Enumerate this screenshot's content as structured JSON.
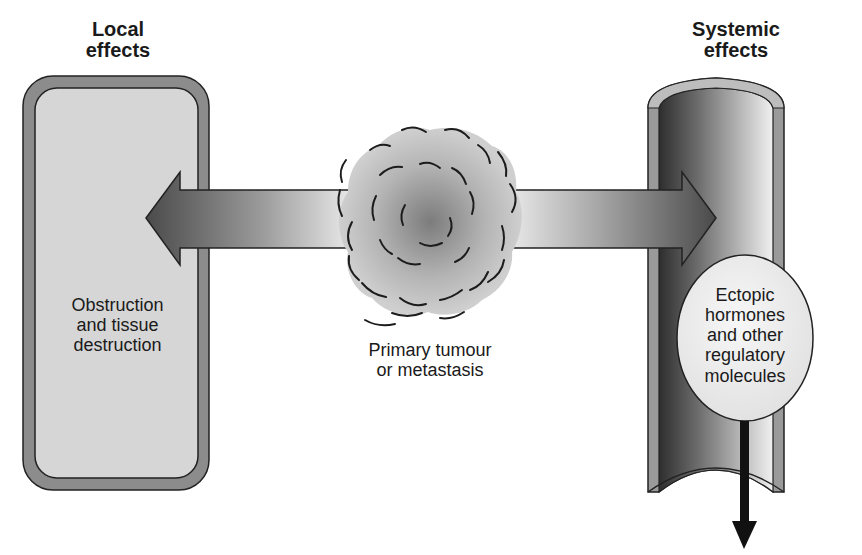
{
  "diagram": {
    "left": {
      "heading_line1": "Local",
      "heading_line2": "effects",
      "box_label_line1": "Obstruction",
      "box_label_line2": "and tissue",
      "box_label_line3": "destruction"
    },
    "center": {
      "label_line1": "Primary tumour",
      "label_line2": "or metastasis"
    },
    "right": {
      "heading_line1": "Systemic",
      "heading_line2": "effects",
      "circle_label_line1": "Ectopic",
      "circle_label_line2": "hormones",
      "circle_label_line3": "and other",
      "circle_label_line4": "regulatory",
      "circle_label_line5": "molecules"
    },
    "icons": {
      "left_arrow": "arrow-left-icon",
      "right_arrow": "arrow-right-icon",
      "down_arrow": "arrow-down-icon",
      "tumour": "tumour-mass-icon",
      "vessel": "blood-vessel-icon",
      "tissue": "tissue-organ-icon"
    },
    "colors": {
      "wall_gray": "#8c8c8c",
      "inner_light": "#d6d6d6",
      "dark": "#3a3a3a",
      "outline": "#222222"
    }
  }
}
